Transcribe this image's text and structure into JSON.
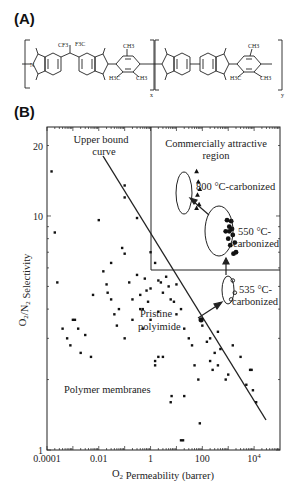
{
  "panels": {
    "a_label": "(A)",
    "b_label": "(B)"
  },
  "structure": {
    "subscript_x": "x",
    "subscript_y": "y",
    "groups": [
      "CF3",
      "F3C",
      "CH3",
      "H3C",
      "CH3",
      "CH3",
      "H3C",
      "CH3"
    ],
    "atoms": [
      "N",
      "O"
    ]
  },
  "chart_data": {
    "type": "scatter",
    "title": "",
    "xlabel": "O2 Permeability (barrer)",
    "ylabel": "O2/N2 Selectivity",
    "xscale": "log",
    "yscale": "log",
    "xlim": [
      0.0001,
      100000
    ],
    "ylim": [
      1,
      24
    ],
    "x_ticks": [
      "0.0001",
      "0.01",
      "1",
      "100",
      "10^4"
    ],
    "y_ticks": [
      "1",
      "10",
      "20"
    ],
    "grid": false,
    "annotations": [
      {
        "text": "Upper bound curve",
        "type": "line",
        "from": [
          0.015,
          15
        ],
        "to": [
          35000,
          1.3
        ]
      },
      {
        "text": "Commercially attractive region",
        "type": "region",
        "x_min": 1,
        "y_min": 6
      },
      {
        "text": "800 °C-carbonized",
        "type": "ellipse-group"
      },
      {
        "text": "550 °C-carbonized",
        "type": "ellipse-group"
      },
      {
        "text": "535 °C-carbonized",
        "type": "ellipse-group"
      },
      {
        "text": "Pristine polyimide",
        "type": "point",
        "x": 90,
        "y": 3.6
      },
      {
        "text": "Polymer membranes",
        "type": "label"
      }
    ],
    "series": [
      {
        "name": "Polymer membranes",
        "marker": "dot",
        "points": [
          [
            0.00015,
            15.5
          ],
          [
            0.0002,
            8.5
          ],
          [
            0.00025,
            5.2
          ],
          [
            0.0004,
            3.3
          ],
          [
            0.0006,
            3.0
          ],
          [
            0.0008,
            2.8
          ],
          [
            0.001,
            3.6
          ],
          [
            0.0012,
            3.6
          ],
          [
            0.0016,
            3.3
          ],
          [
            0.002,
            2.6
          ],
          [
            0.003,
            3.1
          ],
          [
            0.005,
            2.5
          ],
          [
            0.006,
            4.6
          ],
          [
            0.01,
            9.6
          ],
          [
            0.015,
            5.8
          ],
          [
            0.02,
            5.1
          ],
          [
            0.022,
            4.7
          ],
          [
            0.03,
            4.4
          ],
          [
            0.03,
            6.3
          ],
          [
            0.04,
            3.8
          ],
          [
            0.05,
            3.4
          ],
          [
            0.06,
            4.0
          ],
          [
            0.08,
            7.3
          ],
          [
            0.1,
            13.5
          ],
          [
            0.1,
            12.0
          ],
          [
            0.1,
            6.9
          ],
          [
            0.1,
            3.0
          ],
          [
            0.15,
            5.2
          ],
          [
            0.2,
            4.4
          ],
          [
            0.2,
            3.6
          ],
          [
            0.3,
            9.8
          ],
          [
            0.3,
            5.6
          ],
          [
            0.4,
            4.6
          ],
          [
            0.4,
            4.0
          ],
          [
            0.5,
            4.0
          ],
          [
            0.5,
            3.3
          ],
          [
            0.6,
            5.4
          ],
          [
            0.7,
            4.8
          ],
          [
            0.8,
            4.3
          ],
          [
            1.0,
            7.0
          ],
          [
            1.0,
            4.9
          ],
          [
            1.0,
            3.6
          ],
          [
            1.5,
            6.3
          ],
          [
            1.5,
            2.3
          ],
          [
            2.0,
            5.3
          ],
          [
            2.0,
            3.9
          ],
          [
            2.5,
            5.2
          ],
          [
            3.0,
            4.7
          ],
          [
            4.0,
            5.5
          ],
          [
            5.0,
            5.0
          ],
          [
            6.0,
            4.4
          ],
          [
            8.0,
            4.3
          ],
          [
            10.0,
            5.1
          ],
          [
            10.0,
            3.8
          ],
          [
            15.0,
            4.0
          ],
          [
            20.0,
            3.3
          ],
          [
            30.0,
            3.0
          ],
          [
            40.0,
            2.8
          ],
          [
            50.0,
            2.3
          ],
          [
            70.0,
            2.0
          ],
          [
            1.5,
            2.4
          ],
          [
            2.0,
            2.5
          ],
          [
            3.0,
            2.5
          ],
          [
            6.0,
            1.6
          ],
          [
            6.5,
            1.7
          ],
          [
            20.0,
            1.7
          ],
          [
            15.0,
            1.1
          ],
          [
            18.0,
            1.1
          ],
          [
            80.0,
            1.3
          ],
          [
            200,
            2.4
          ],
          [
            250,
            2.2
          ],
          [
            400,
            2.3
          ],
          [
            800,
            2.0
          ],
          [
            1000,
            2.1
          ],
          [
            7000,
            2.2
          ],
          [
            8000,
            2.2
          ],
          [
            5000,
            1.9
          ],
          [
            9000,
            1.8
          ],
          [
            12000,
            1.6
          ],
          [
            300,
            2.6
          ],
          [
            500,
            2.7
          ],
          [
            1500,
            2.8
          ],
          [
            3000,
            2.5
          ],
          [
            200,
            3.0
          ],
          [
            400,
            3.2
          ],
          [
            100,
            3.4
          ],
          [
            150,
            2.9
          ]
        ]
      },
      {
        "name": "Pristine polyimide",
        "marker": "large-dot",
        "points": [
          [
            90,
            3.6
          ]
        ]
      },
      {
        "name": "535 °C-carbonized",
        "marker": "open-circle",
        "points": [
          [
            1500,
            5.3
          ],
          [
            1800,
            4.7
          ],
          [
            1300,
            4.4
          ]
        ]
      },
      {
        "name": "550 °C-carbonized",
        "marker": "filled-circle",
        "points": [
          [
            900,
            9.6
          ],
          [
            1100,
            9.0
          ],
          [
            1300,
            9.5
          ],
          [
            800,
            8.6
          ],
          [
            1000,
            8.0
          ],
          [
            1500,
            8.3
          ],
          [
            1200,
            7.5
          ],
          [
            1800,
            7.7
          ],
          [
            1600,
            6.9
          ],
          [
            2000,
            7.0
          ],
          [
            1100,
            8.6
          ],
          [
            1400,
            8.8
          ]
        ]
      },
      {
        "name": "800 °C-carbonized",
        "marker": "triangle",
        "points": [
          [
            60,
            15.5
          ],
          [
            70,
            14.0
          ],
          [
            80,
            13.0
          ],
          [
            65,
            12.3
          ],
          [
            75,
            11.2
          ],
          [
            60,
            10.8
          ]
        ]
      }
    ]
  }
}
